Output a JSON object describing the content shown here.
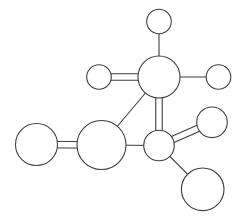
{
  "diagram": {
    "type": "ball-and-stick-molecule",
    "width": 242,
    "height": 221,
    "stroke_color": "#3f3f3f",
    "fill_color": "#ffffff",
    "atoms": [
      {
        "id": "top",
        "cx": 159,
        "cy": 21.5,
        "r": 12.3
      },
      {
        "id": "center",
        "cx": 159,
        "cy": 77,
        "r": 21
      },
      {
        "id": "left-small",
        "cx": 99,
        "cy": 77,
        "r": 12.3
      },
      {
        "id": "right-small",
        "cx": 218.5,
        "cy": 77,
        "r": 12.3
      },
      {
        "id": "far-left",
        "cx": 36.5,
        "cy": 144.5,
        "r": 21
      },
      {
        "id": "middle",
        "cx": 101.5,
        "cy": 145,
        "r": 24.5
      },
      {
        "id": "junction",
        "cx": 159,
        "cy": 145.5,
        "r": 15.3
      },
      {
        "id": "upper-right",
        "cx": 212,
        "cy": 122.3,
        "r": 15.3
      },
      {
        "id": "lower-right",
        "cx": 202.7,
        "cy": 189.3,
        "r": 21.3
      }
    ],
    "bonds": [
      {
        "from": "top",
        "to": "center",
        "order": 1
      },
      {
        "from": "center",
        "to": "right-small",
        "order": 1
      },
      {
        "from": "left-small",
        "to": "center",
        "order": 2
      },
      {
        "from": "center",
        "to": "junction",
        "order": 2
      },
      {
        "from": "center",
        "to": "middle",
        "order": 1
      },
      {
        "from": "far-left",
        "to": "middle",
        "order": 2
      },
      {
        "from": "middle",
        "to": "junction",
        "order": 1
      },
      {
        "from": "junction",
        "to": "upper-right",
        "order": 2
      },
      {
        "from": "junction",
        "to": "lower-right",
        "order": 1
      }
    ],
    "double_bond_spacing": 6.5
  }
}
